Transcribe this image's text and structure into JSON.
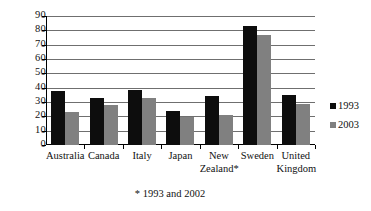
{
  "chart_data": {
    "type": "bar",
    "title": "",
    "xlabel": "",
    "ylabel": "",
    "ylim": [
      0,
      90
    ],
    "ytick_step": 10,
    "yticks": [
      "0",
      "10",
      "20",
      "30",
      "40",
      "50",
      "60",
      "70",
      "80",
      "90"
    ],
    "grid": true,
    "legend_position": "right",
    "categories": [
      "Australia",
      "Canada",
      "Italy",
      "Japan",
      "New Zealand*",
      "Sweden",
      "United Kingdom"
    ],
    "category_lines": [
      [
        "Australia"
      ],
      [
        "Canada"
      ],
      [
        "Italy"
      ],
      [
        "Japan"
      ],
      [
        "New",
        "Zealand*"
      ],
      [
        "Sweden"
      ],
      [
        "United",
        "Kingdom"
      ]
    ],
    "series": [
      {
        "name": "1993",
        "color": "#0d0d0d",
        "values": [
          37.5,
          32.5,
          38.5,
          24,
          34,
          83,
          35
        ]
      },
      {
        "name": "2003",
        "color": "#808080",
        "values": [
          23,
          28,
          33,
          19.5,
          21,
          77,
          28.5
        ]
      }
    ],
    "annotations": [
      "* 1993 and 2002"
    ]
  },
  "legend": {
    "items": [
      {
        "label": "1993"
      },
      {
        "label": "2003"
      }
    ]
  },
  "footnote": {
    "text": "* 1993 and 2002"
  },
  "colors": {
    "series_1993": "#0d0d0d",
    "series_2003": "#808080",
    "gridline": "#6f6f6f",
    "axis": "#000000",
    "background": "#ffffff"
  }
}
